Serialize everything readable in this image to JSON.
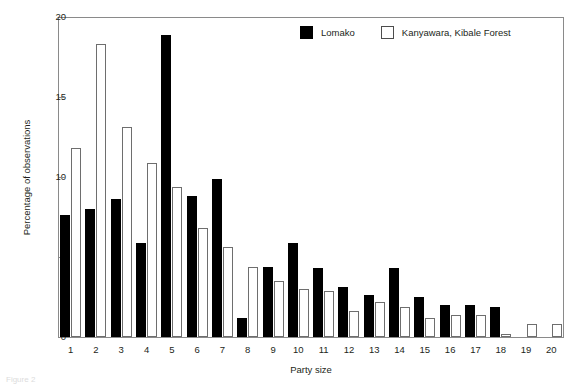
{
  "chart_data": {
    "type": "bar",
    "title": "",
    "xlabel": "Party size",
    "ylabel": "Percentage of observations",
    "categories": [
      "1",
      "2",
      "3",
      "4",
      "5",
      "6",
      "7",
      "8",
      "9",
      "10",
      "11",
      "12",
      "13",
      "14",
      "15",
      "16",
      "17",
      "18",
      "19",
      "20"
    ],
    "ylim": [
      0,
      20
    ],
    "yticks": [
      0,
      5,
      10,
      15,
      20
    ],
    "ytick_labels": [
      "0",
      "5",
      "10",
      "15",
      "20"
    ],
    "grid": false,
    "legend_position": "top-right",
    "series": [
      {
        "name": "Lomako",
        "color": "#000000",
        "style": "filled",
        "values": [
          7.6,
          8.0,
          8.6,
          5.9,
          18.9,
          8.8,
          9.9,
          1.2,
          4.4,
          5.9,
          4.3,
          3.1,
          2.6,
          4.3,
          2.5,
          2.0,
          2.0,
          1.9,
          0,
          0
        ]
      },
      {
        "name": "Kanyawara, Kibale Forest",
        "color": "#ffffff",
        "style": "open",
        "values": [
          11.8,
          18.3,
          13.1,
          10.9,
          9.4,
          6.8,
          5.6,
          4.4,
          3.5,
          3.0,
          2.9,
          1.6,
          2.2,
          1.9,
          1.2,
          1.4,
          1.4,
          0.2,
          0.8,
          0.8
        ]
      }
    ]
  },
  "legend": {
    "items": [
      {
        "label": "Lomako",
        "swatch": "filled-square-swatch"
      },
      {
        "label": "Kanyawara, Kibale Forest",
        "swatch": "open-square-swatch"
      }
    ]
  },
  "axes": {
    "y_title": "Percentage of observations",
    "x_title": "Party size"
  },
  "caption": "Figure 2"
}
